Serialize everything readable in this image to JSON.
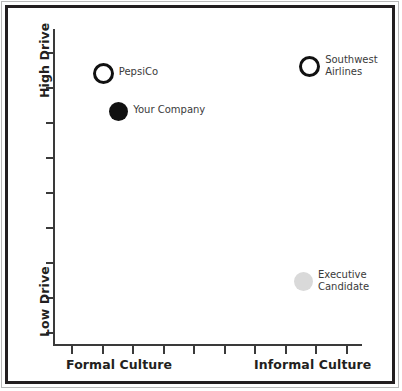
{
  "chart_data": {
    "type": "scatter",
    "title": "",
    "xlabel": "",
    "ylabel": "",
    "xlim": [
      0,
      10
    ],
    "ylim": [
      0,
      10
    ],
    "grid": false,
    "legend": "none",
    "axis_labels": {
      "y_top": "High Drive",
      "y_bottom": "Low Drive",
      "x_left": "Formal Culture",
      "x_right": "Informal Culture"
    },
    "x_tick_count": 10,
    "y_tick_count": 9,
    "points": [
      {
        "label": "PepsiCo",
        "x": 1.6,
        "y": 8.6,
        "marker": "hollow-circle",
        "color": "#111111",
        "size": 21
      },
      {
        "label": "Your Company",
        "x": 2.1,
        "y": 7.4,
        "marker": "filled-circle",
        "color": "#111111",
        "size": 19
      },
      {
        "label": "Southwest\nAirlines",
        "x": 8.3,
        "y": 8.8,
        "marker": "hollow-circle",
        "color": "#111111",
        "size": 21
      },
      {
        "label": "Executive\nCandidate",
        "x": 8.1,
        "y": 2.0,
        "marker": "filled-circle",
        "color": "#d9d9d9",
        "size": 19
      }
    ]
  },
  "figure": {
    "border_color": "#231f20",
    "outer_border_color": "#b9b9b9",
    "axis_color": "#3a3a3a",
    "background": "#ffffff"
  }
}
